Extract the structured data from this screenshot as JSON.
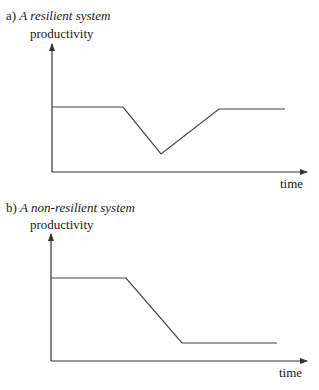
{
  "panels": [
    {
      "prefix": "a) ",
      "title": "A resilient system",
      "ylabel": "productivity",
      "xlabel": "time",
      "curve": [
        [
          52,
          107
        ],
        [
          123,
          107
        ],
        [
          161,
          154
        ],
        [
          219,
          109
        ],
        [
          285,
          109
        ]
      ]
    },
    {
      "prefix": "b) ",
      "title": "A non-resilient system",
      "ylabel": "productivity",
      "xlabel": "time",
      "curve": [
        [
          51,
          278
        ],
        [
          126,
          278
        ],
        [
          182,
          343
        ],
        [
          277,
          343
        ]
      ]
    }
  ],
  "chart_data": [
    {
      "type": "line",
      "title": "a) A resilient system",
      "xlabel": "time",
      "ylabel": "productivity",
      "grid": false,
      "series": [
        {
          "name": "productivity",
          "x": [
            0,
            0.28,
            0.43,
            0.66,
            0.92
          ],
          "y": [
            0.5,
            0.5,
            0.14,
            0.48,
            0.48
          ]
        }
      ],
      "annotations": [
        "Productivity drops after a disturbance, then recovers to near its original level"
      ]
    },
    {
      "type": "line",
      "title": "b) A non-resilient system",
      "xlabel": "time",
      "ylabel": "productivity",
      "grid": false,
      "series": [
        {
          "name": "productivity",
          "x": [
            0,
            0.3,
            0.52,
            0.9
          ],
          "y": [
            0.65,
            0.65,
            0.14,
            0.14
          ]
        }
      ],
      "annotations": [
        "Productivity drops after a disturbance and stays at a low level"
      ]
    }
  ]
}
